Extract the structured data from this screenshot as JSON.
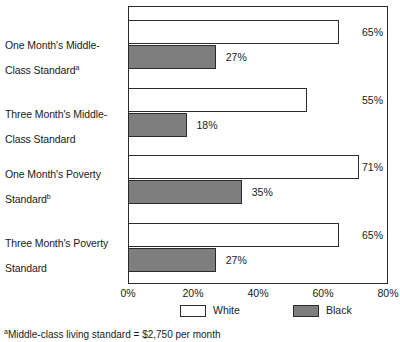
{
  "chart_data": {
    "type": "bar",
    "orientation": "horizontal",
    "title": "",
    "xlabel": "",
    "ylabel": "",
    "xlim": [
      0,
      80
    ],
    "grid": false,
    "legend_position": "bottom",
    "categories": [
      "One Month's Middle-Class Standard",
      "Three Month's Middle-Class Standard",
      "One Month's Poverty Standard",
      "Three Month's Poverty Standard"
    ],
    "category_lines": [
      [
        "One Month's Middle-",
        "Class Standard"
      ],
      [
        "Three Month's Middle-",
        "Class Standard"
      ],
      [
        "One Month's Poverty",
        "Standard"
      ],
      [
        "Three Month's Poverty",
        "Standard"
      ]
    ],
    "category_footnote_marks": [
      "a",
      "",
      "b",
      ""
    ],
    "series": [
      {
        "name": "White",
        "color": "#ffffff",
        "values": [
          65,
          55,
          71,
          65
        ],
        "value_labels": [
          "65%",
          "55%",
          "71%",
          "65%"
        ]
      },
      {
        "name": "Black",
        "color": "#7e7e7e",
        "values": [
          27,
          18,
          35,
          27
        ],
        "value_labels": [
          "27%",
          "18%",
          "35%",
          "27%"
        ]
      }
    ],
    "xticks": [
      0,
      20,
      40,
      60,
      80
    ],
    "xtick_labels": [
      "0%",
      "20%",
      "40%",
      "60%",
      "80%"
    ]
  },
  "legend": {
    "items": [
      {
        "label": "White",
        "swatch": "white"
      },
      {
        "label": "Black",
        "swatch": "black"
      }
    ]
  },
  "footnote": {
    "mark": "a",
    "text": "Middle-class living standard = $2,750 per month"
  },
  "colors": {
    "bar_white_fill": "#ffffff",
    "bar_black_fill": "#7e7e7e",
    "stroke": "#2b2b2b",
    "text": "#1a1a1a",
    "background": "#ffffff"
  }
}
